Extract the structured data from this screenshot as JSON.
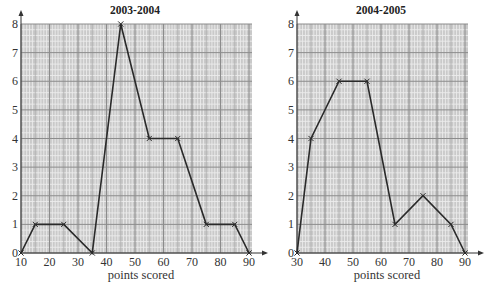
{
  "chart_data": [
    {
      "type": "line",
      "title": "2003-2004",
      "xlabel": "points scored",
      "ylabel": "",
      "x": [
        10,
        15,
        25,
        35,
        45,
        55,
        65,
        75,
        85,
        90
      ],
      "values": [
        0,
        1,
        1,
        0,
        8,
        4,
        4,
        1,
        1,
        0
      ],
      "xticks": [
        10,
        20,
        30,
        40,
        50,
        60,
        70,
        80,
        90
      ],
      "yticks": [
        0,
        1,
        2,
        3,
        4,
        5,
        6,
        7,
        8
      ],
      "xlim": [
        10,
        90
      ],
      "ylim": [
        0,
        8
      ],
      "grid": true,
      "marker": "x",
      "legend": null
    },
    {
      "type": "line",
      "title": "2004-2005",
      "xlabel": "points scored",
      "ylabel": "",
      "x": [
        30,
        35,
        45,
        55,
        65,
        75,
        85,
        90
      ],
      "values": [
        0,
        4,
        6,
        6,
        1,
        2,
        1,
        0
      ],
      "xticks": [
        30,
        40,
        50,
        60,
        70,
        80,
        90
      ],
      "yticks": [
        0,
        1,
        2,
        3,
        4,
        5,
        6,
        7,
        8
      ],
      "xlim": [
        30,
        90
      ],
      "ylim": [
        0,
        8
      ],
      "grid": true,
      "marker": "x",
      "legend": null
    }
  ],
  "colors": {
    "grid_bg": "#c9c9c9",
    "grid_minor": "#ececec",
    "grid_major": "#8c8c8c",
    "line": "#2a2a2a"
  }
}
